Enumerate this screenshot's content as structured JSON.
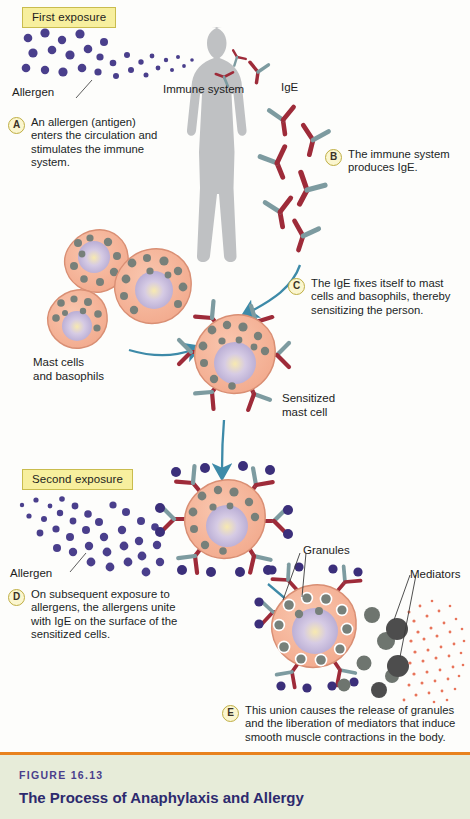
{
  "figure": {
    "number": "FIGURE 16.13",
    "title": "The Process of Anaphylaxis and Allergy"
  },
  "phases": [
    {
      "id": "first-exposure",
      "label": "First exposure"
    },
    {
      "id": "second-exposure",
      "label": "Second exposure"
    }
  ],
  "labels": {
    "allergen_top": "Allergen",
    "allergen_bottom": "Allergen",
    "immune_system": "Immune system",
    "ige": "IgE",
    "mast_cells": "Mast cells\nand basophils",
    "mast_cells_line1": "Mast cells",
    "mast_cells_line2": "and basophils",
    "sensitized_line1": "Sensitized",
    "sensitized_line2": "mast cell",
    "granules": "Granules",
    "mediators": "Mediators"
  },
  "steps": [
    {
      "letter": "A",
      "text": "An allergen (antigen) enters the circulation and stimulates the immune system."
    },
    {
      "letter": "B",
      "text": "The immune system produces IgE."
    },
    {
      "letter": "C",
      "text": "The IgE fixes itself to mast cells and basophils, thereby sensitizing the person."
    },
    {
      "letter": "D",
      "text": "On subsequent exposure to allergens, the allergens unite with IgE on the surface of the sensitized cells."
    },
    {
      "letter": "E",
      "text": "This union causes the release of granules and the liberation of mediators that induce smooth muscle contractions in the body."
    }
  ],
  "colors": {
    "background": "#fdfdfb",
    "badge_fill": "#f7ef9e",
    "badge_border": "#c9bc4e",
    "allergen_dot": "#4a3f8c",
    "antibody_red": "#9e2b39",
    "antibody_teal": "#7d9ba0",
    "cell_body": "#f5b49a",
    "cell_outline": "#d98f74",
    "nucleus": "#bbb0d8",
    "nucleus_core": "#f6e6a8",
    "granule": "#77807a",
    "arrow_teal": "#3d8aa8",
    "silhouette": "#bfc1c3",
    "mediator_dot": "#e8745a",
    "caption_band": "#e7ecd9",
    "caption_rule": "#e8821e",
    "caption_num": "#4a3f8c",
    "caption_title": "#2d2a6e"
  },
  "graphic_elements": {
    "human_silhouette": "standing adult figure, gray, facing forward",
    "arrows": [
      {
        "name": "arrow-ige-to-mastcell",
        "direction": "down-left"
      },
      {
        "name": "arrow-mastcells-to-sensitized",
        "direction": "right"
      },
      {
        "name": "arrow-sensitized-to-second-exposure",
        "direction": "down"
      },
      {
        "name": "arrow-second-to-degranulation",
        "direction": "down-right"
      }
    ],
    "antibody_count_free": 9,
    "antibody_count_sensitized_cell": 6,
    "antibody_count_bound_cell": 6,
    "mast_cell_cluster_count": 3
  }
}
